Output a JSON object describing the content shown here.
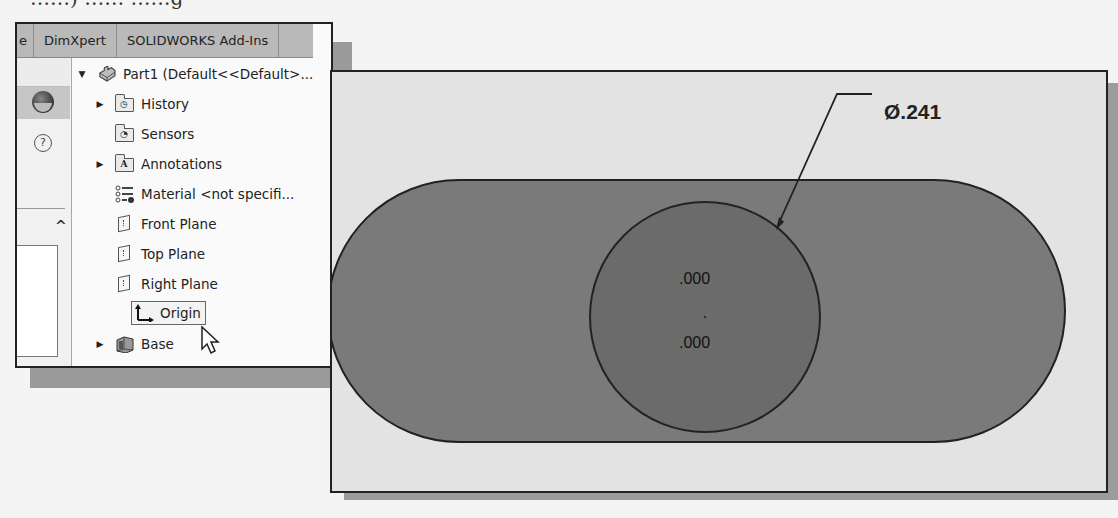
{
  "caption": {
    "partial_text": "……) …… ……g"
  },
  "feature_manager": {
    "tabs": [
      {
        "label": "e",
        "truncated": true
      },
      {
        "label": "DimXpert"
      },
      {
        "label": "SOLIDWORKS Add-Ins"
      }
    ],
    "side_icons": [
      "appearances-icon",
      "help-icon",
      "chevron-up-icon"
    ],
    "tree": {
      "root": {
        "label": "Part1  (Default<<Default>...",
        "expanded": true,
        "icon": "part-icon"
      },
      "items": [
        {
          "label": "History",
          "icon": "history-folder-icon",
          "expandable": true
        },
        {
          "label": "Sensors",
          "icon": "sensors-folder-icon",
          "expandable": false
        },
        {
          "label": "Annotations",
          "icon": "annotations-folder-icon",
          "expandable": true
        },
        {
          "label": "Material <not specifi...",
          "icon": "material-icon",
          "expandable": false
        },
        {
          "label": "Front Plane",
          "icon": "plane-icon",
          "expandable": false
        },
        {
          "label": "Top Plane",
          "icon": "plane-icon",
          "expandable": false
        },
        {
          "label": "Right Plane",
          "icon": "plane-icon",
          "expandable": false
        },
        {
          "label": "Origin",
          "icon": "origin-icon",
          "expandable": false,
          "hovered": true
        },
        {
          "label": "Base",
          "icon": "base-extrude-icon",
          "expandable": true
        }
      ]
    }
  },
  "graphics": {
    "diameter_dimension": "Ø.241",
    "circle_center_coords": {
      "x": ".000",
      "y": ".000"
    },
    "colors": {
      "background": "#e3e3e3",
      "slot_fill": "#7a7a7a",
      "circle_fill": "#6b6b6b",
      "outline": "#222222"
    }
  }
}
